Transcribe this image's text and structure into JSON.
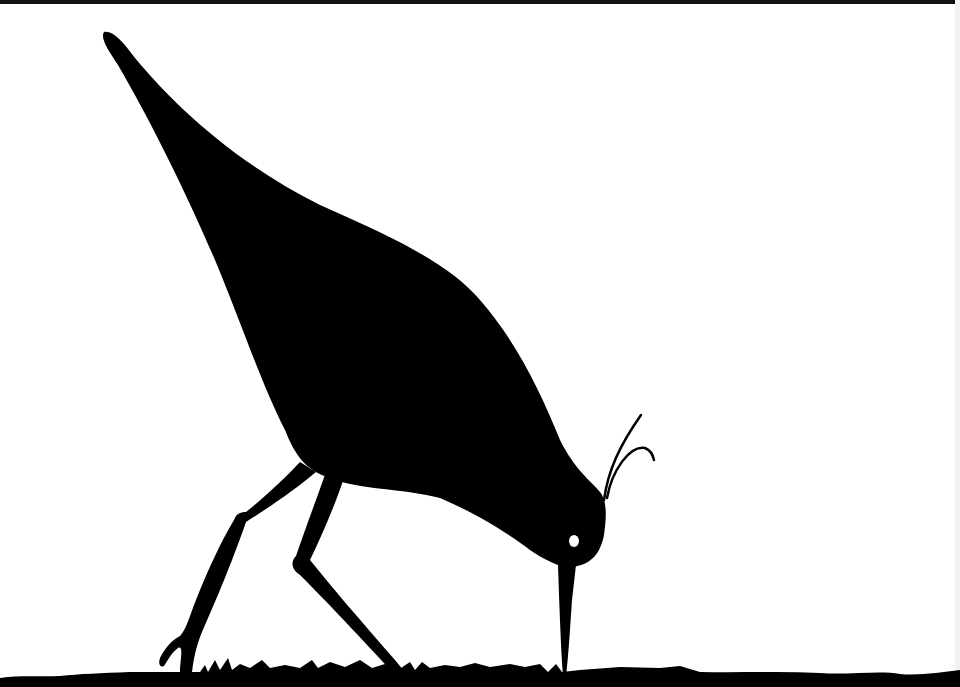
{
  "image": {
    "description": "Black paper-cut silhouette of a wading bird (curlew/sandpiper) probing the ground with its beak, standing on a grassy ground strip",
    "colors": {
      "background": "#ffffff",
      "silhouette": "#000000",
      "eye": "#ffffff"
    }
  }
}
